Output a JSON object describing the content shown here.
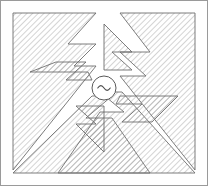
{
  "figure": {
    "title": "Radial hatched antenna pattern schematic",
    "width": 208,
    "height": 186,
    "background_color": "#ffffff",
    "frame": {
      "label": "image border",
      "color": "#9a9a9a",
      "x": 0.5,
      "y": 0.5,
      "width": 207,
      "height": 185
    },
    "center_source": {
      "label": "AC source",
      "symbol": "~",
      "cx": 104,
      "cy": 88,
      "r": 12,
      "stroke_color": "#5a5a5a",
      "fill_color": "#ffffff",
      "glyph_color": "#4a4a4a"
    },
    "hatch": {
      "label": "45 degree diagonal hatch",
      "angle_degrees": 45,
      "spacing": 4,
      "line_color": "#8c8c8c",
      "line_width": 0.75
    },
    "outline": {
      "color": "#6e6e6e",
      "width": 0.9
    },
    "shapes": [
      {
        "name": "top-left-corner-mass",
        "quadrant": "top-left",
        "points": "13,13 13,170 96,66 74,66 96,44 68,44 96,13"
      },
      {
        "name": "top-right-corner-mass",
        "quadrant": "top-right",
        "points": "195,13 195,170 120,76 146,76 120,52 150,52 120,13"
      },
      {
        "name": "bottom-left-corner-mass",
        "quadrant": "bottom-left",
        "points": "13,173 150,173 112,118 86,118 112,96 92,96 13,173"
      },
      {
        "name": "bottom-right-corner-mass",
        "quadrant": "bottom-right",
        "points": "195,173 58,173 100,112 124,112 100,92 122,92 195,173"
      },
      {
        "name": "upper-left-chevron-arm",
        "quadrant": "left",
        "points": "30,72 88,72 92,80 66,80 86,62 56,62"
      },
      {
        "name": "upper-right-chevron-arm",
        "quadrant": "top",
        "points": "104,24 132,52 112,52 132,70 104,70"
      },
      {
        "name": "lower-right-chevron-arm",
        "quadrant": "right",
        "points": "178,96 120,96 116,104 142,104 122,122 152,122"
      },
      {
        "name": "lower-left-chevron-arm",
        "quadrant": "bottom",
        "points": "104,152 76,124 96,124 76,106 104,106"
      }
    ]
  }
}
